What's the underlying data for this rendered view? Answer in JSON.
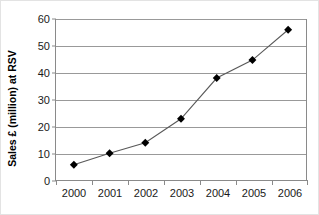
{
  "chart_data": {
    "type": "line",
    "title": "",
    "subtitle": "",
    "xlabel": "",
    "ylabel": "Sales £ (million) at RSV",
    "categories": [
      "2000",
      "2001",
      "2002",
      "2003",
      "2004",
      "2005",
      "2006"
    ],
    "series": [
      {
        "name": "Sales",
        "values": [
          5.7,
          10.0,
          13.9,
          22.8,
          38.0,
          44.7,
          56.0
        ]
      }
    ],
    "ylim": [
      0,
      60
    ],
    "y_ticks": [
      0,
      10,
      20,
      30,
      40,
      50,
      60
    ],
    "y_tick_labels": [
      "0",
      "10",
      "20",
      "30",
      "40",
      "50",
      "60"
    ],
    "grid": "horizontal",
    "legend": "none",
    "marker": "diamond",
    "marker_color": "#000000",
    "line_color": "#595959",
    "gridline_color": "#999999",
    "axis_color": "#8a8a8a",
    "background_color": "#ffffff"
  }
}
